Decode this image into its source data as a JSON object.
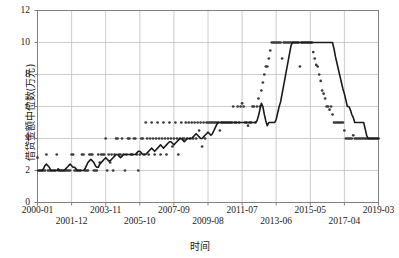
{
  "chart_data": {
    "type": "line",
    "title": "",
    "xlabel": "时间",
    "ylabel": "借贷金额中位数(万元)",
    "ylim": [
      0,
      12
    ],
    "yticks": [
      0,
      2,
      4,
      6,
      8,
      10,
      12
    ],
    "ytick_labels": [
      "0",
      "2",
      "4",
      "6",
      "8",
      "10",
      "12"
    ],
    "grid": true,
    "legend": "none",
    "xtick_labels": [
      "2000-01",
      "2001-12",
      "2003-11",
      "2005-10",
      "2007-09",
      "2009-08",
      "2011-07",
      "2013-06",
      "2015-05",
      "2017-04",
      "2019-03"
    ],
    "xtick_rows": [
      0,
      1,
      0,
      1,
      0,
      1,
      0,
      1,
      0,
      1,
      0
    ],
    "x_start": "2000-01",
    "x_end": "2019-03",
    "x_index_range": [
      0,
      230
    ],
    "series": [
      {
        "name": "median-line",
        "type": "line",
        "color": "#1a1a1a",
        "values": [
          2.0,
          2.0,
          2.0,
          2.0,
          2.1,
          2.3,
          2.4,
          2.3,
          2.2,
          2.0,
          2.0,
          2.0,
          2.0,
          2.0,
          2.1,
          2.0,
          2.0,
          2.0,
          2.0,
          2.1,
          2.2,
          2.3,
          2.4,
          2.3,
          2.2,
          2.2,
          2.1,
          2.0,
          2.0,
          2.0,
          2.0,
          2.0,
          2.1,
          2.3,
          2.5,
          2.6,
          2.7,
          2.6,
          2.5,
          2.3,
          2.2,
          2.2,
          2.4,
          2.5,
          2.6,
          2.7,
          2.8,
          2.7,
          2.6,
          2.6,
          2.7,
          2.8,
          2.9,
          3.0,
          3.0,
          2.9,
          2.8,
          2.9,
          3.0,
          3.0,
          3.0,
          3.0,
          3.0,
          3.0,
          3.0,
          3.0,
          3.0,
          3.1,
          3.2,
          3.2,
          3.1,
          3.0,
          3.0,
          3.0,
          3.1,
          3.2,
          3.3,
          3.4,
          3.3,
          3.2,
          3.3,
          3.4,
          3.5,
          3.6,
          3.5,
          3.4,
          3.5,
          3.6,
          3.7,
          3.8,
          3.8,
          3.7,
          3.6,
          3.7,
          3.8,
          3.9,
          4.0,
          4.0,
          3.9,
          3.8,
          3.9,
          4.0,
          4.0,
          4.0,
          4.0,
          4.1,
          4.2,
          4.3,
          4.2,
          4.1,
          4.0,
          4.0,
          4.1,
          4.2,
          4.3,
          4.4,
          4.3,
          4.2,
          4.3,
          4.5,
          4.7,
          4.9,
          5.0,
          5.0,
          5.0,
          5.0,
          5.0,
          5.0,
          5.0,
          5.0,
          5.0,
          5.0,
          5.0,
          5.0,
          5.0,
          5.0,
          5.0,
          5.0,
          5.0,
          5.0,
          5.0,
          5.0,
          5.0,
          5.0,
          5.0,
          5.0,
          5.0,
          5.0,
          5.1,
          5.4,
          5.8,
          6.2,
          6.0,
          5.5,
          5.1,
          4.8,
          5.0,
          5.0,
          5.0,
          5.0,
          5.0,
          5.2,
          5.6,
          6.0,
          6.3,
          6.8,
          7.3,
          7.8,
          8.3,
          8.8,
          9.3,
          9.8,
          10.0,
          10.0,
          10.0,
          10.0,
          10.0,
          10.0,
          10.0,
          10.0,
          10.0,
          10.0,
          10.0,
          10.0,
          10.0,
          10.0,
          10.0,
          10.0,
          10.0,
          10.0,
          10.0,
          10.0,
          10.0,
          10.0,
          10.0,
          10.0,
          10.0,
          10.0,
          10.0,
          10.0,
          9.6,
          9.1,
          8.7,
          8.3,
          7.9,
          7.5,
          7.1,
          6.8,
          6.4,
          6.0,
          6.0,
          5.8,
          5.5,
          5.3,
          5.0,
          5.0,
          5.0,
          5.0,
          5.0,
          5.0,
          5.0,
          4.6,
          4.2,
          4.0,
          4.0,
          4.0,
          4.0,
          4.0,
          4.0,
          4.0,
          4.0
        ]
      },
      {
        "name": "monthly-observations",
        "type": "scatter",
        "color": "#3a3a3a",
        "points": [
          [
            0,
            2.8
          ],
          [
            1,
            2.0
          ],
          [
            2,
            2.0
          ],
          [
            3,
            2.0
          ],
          [
            4,
            2.0
          ],
          [
            5,
            2.0
          ],
          [
            6,
            3.0
          ],
          [
            7,
            2.0
          ],
          [
            8,
            2.0
          ],
          [
            9,
            2.0
          ],
          [
            10,
            2.0
          ],
          [
            11,
            2.0
          ],
          [
            12,
            2.0
          ],
          [
            13,
            3.0
          ],
          [
            14,
            2.0
          ],
          [
            15,
            2.0
          ],
          [
            16,
            2.0
          ],
          [
            17,
            2.0
          ],
          [
            18,
            2.0
          ],
          [
            19,
            2.0
          ],
          [
            20,
            2.0
          ],
          [
            21,
            2.0
          ],
          [
            22,
            2.0
          ],
          [
            23,
            3.0
          ],
          [
            24,
            3.0
          ],
          [
            25,
            2.0
          ],
          [
            26,
            2.0
          ],
          [
            27,
            2.0
          ],
          [
            28,
            2.0
          ],
          [
            29,
            2.0
          ],
          [
            30,
            3.0
          ],
          [
            31,
            3.0
          ],
          [
            32,
            2.0
          ],
          [
            33,
            2.0
          ],
          [
            34,
            2.0
          ],
          [
            35,
            3.0
          ],
          [
            36,
            3.0
          ],
          [
            37,
            3.0
          ],
          [
            38,
            2.0
          ],
          [
            39,
            2.0
          ],
          [
            40,
            2.0
          ],
          [
            41,
            3.0
          ],
          [
            42,
            2.5
          ],
          [
            43,
            3.0
          ],
          [
            44,
            3.0
          ],
          [
            45,
            3.0
          ],
          [
            46,
            4.0
          ],
          [
            47,
            2.0
          ],
          [
            48,
            3.0
          ],
          [
            49,
            2.5
          ],
          [
            50,
            3.0
          ],
          [
            51,
            2.0
          ],
          [
            52,
            3.0
          ],
          [
            53,
            4.0
          ],
          [
            54,
            4.0
          ],
          [
            55,
            3.0
          ],
          [
            56,
            3.0
          ],
          [
            57,
            4.0
          ],
          [
            58,
            3.0
          ],
          [
            59,
            2.0
          ],
          [
            60,
            3.0
          ],
          [
            61,
            4.0
          ],
          [
            62,
            4.0
          ],
          [
            63,
            3.0
          ],
          [
            64,
            3.0
          ],
          [
            65,
            4.0
          ],
          [
            66,
            4.0
          ],
          [
            67,
            3.0
          ],
          [
            68,
            2.0
          ],
          [
            69,
            3.0
          ],
          [
            70,
            4.0
          ],
          [
            71,
            4.0
          ],
          [
            72,
            3.0
          ],
          [
            73,
            5.0
          ],
          [
            74,
            4.0
          ],
          [
            75,
            3.0
          ],
          [
            76,
            4.0
          ],
          [
            77,
            5.0
          ],
          [
            78,
            4.0
          ],
          [
            79,
            3.0
          ],
          [
            80,
            4.0
          ],
          [
            81,
            5.0
          ],
          [
            82,
            4.0
          ],
          [
            83,
            3.0
          ],
          [
            84,
            4.0
          ],
          [
            85,
            5.0
          ],
          [
            86,
            4.0
          ],
          [
            87,
            3.0
          ],
          [
            88,
            4.0
          ],
          [
            89,
            5.0
          ],
          [
            90,
            4.0
          ],
          [
            91,
            3.5
          ],
          [
            92,
            4.0
          ],
          [
            93,
            5.0
          ],
          [
            94,
            4.0
          ],
          [
            95,
            3.0
          ],
          [
            96,
            4.0
          ],
          [
            97,
            5.0
          ],
          [
            98,
            4.0
          ],
          [
            99,
            4.0
          ],
          [
            100,
            5.0
          ],
          [
            101,
            4.0
          ],
          [
            102,
            5.0
          ],
          [
            103,
            4.0
          ],
          [
            104,
            5.0
          ],
          [
            105,
            4.0
          ],
          [
            106,
            5.0
          ],
          [
            107,
            4.0
          ],
          [
            108,
            5.0
          ],
          [
            109,
            4.5
          ],
          [
            110,
            5.0
          ],
          [
            111,
            3.5
          ],
          [
            112,
            5.0
          ],
          [
            113,
            4.0
          ],
          [
            114,
            5.0
          ],
          [
            115,
            5.0
          ],
          [
            116,
            5.0
          ],
          [
            117,
            5.0
          ],
          [
            118,
            5.0
          ],
          [
            119,
            5.0
          ],
          [
            120,
            5.0
          ],
          [
            121,
            5.0
          ],
          [
            122,
            5.0
          ],
          [
            123,
            4.5
          ],
          [
            124,
            5.0
          ],
          [
            125,
            5.0
          ],
          [
            126,
            5.0
          ],
          [
            127,
            5.0
          ],
          [
            128,
            5.0
          ],
          [
            129,
            5.0
          ],
          [
            130,
            5.0
          ],
          [
            131,
            5.0
          ],
          [
            132,
            6.0
          ],
          [
            133,
            5.0
          ],
          [
            134,
            5.0
          ],
          [
            135,
            6.0
          ],
          [
            136,
            5.0
          ],
          [
            137,
            6.0
          ],
          [
            138,
            6.2
          ],
          [
            139,
            6.0
          ],
          [
            140,
            5.0
          ],
          [
            141,
            5.0
          ],
          [
            142,
            4.8
          ],
          [
            143,
            5.0
          ],
          [
            144,
            5.0
          ],
          [
            145,
            6.0
          ],
          [
            146,
            6.0
          ],
          [
            147,
            5.0
          ],
          [
            148,
            6.0
          ],
          [
            149,
            6.5
          ],
          [
            150,
            6.0
          ],
          [
            151,
            7.0
          ],
          [
            152,
            7.5
          ],
          [
            153,
            8.0
          ],
          [
            154,
            8.5
          ],
          [
            155,
            8.5
          ],
          [
            156,
            9.0
          ],
          [
            157,
            9.5
          ],
          [
            158,
            10.0
          ],
          [
            159,
            10.0
          ],
          [
            160,
            10.0
          ],
          [
            161,
            10.0
          ],
          [
            162,
            10.0
          ],
          [
            163,
            10.0
          ],
          [
            164,
            10.0
          ],
          [
            165,
            9.0
          ],
          [
            166,
            10.0
          ],
          [
            167,
            10.0
          ],
          [
            168,
            10.0
          ],
          [
            169,
            10.0
          ],
          [
            170,
            10.0
          ],
          [
            171,
            10.0
          ],
          [
            172,
            10.0
          ],
          [
            173,
            10.0
          ],
          [
            174,
            10.0
          ],
          [
            175,
            10.0
          ],
          [
            176,
            10.0
          ],
          [
            177,
            8.5
          ],
          [
            178,
            10.0
          ],
          [
            179,
            10.0
          ],
          [
            180,
            10.0
          ],
          [
            181,
            10.0
          ],
          [
            182,
            10.0
          ],
          [
            183,
            10.0
          ],
          [
            184,
            10.0
          ],
          [
            185,
            10.0
          ],
          [
            186,
            9.4
          ],
          [
            187,
            9.0
          ],
          [
            188,
            8.6
          ],
          [
            189,
            8.5
          ],
          [
            190,
            8.0
          ],
          [
            191,
            7.6
          ],
          [
            192,
            7.0
          ],
          [
            193,
            6.8
          ],
          [
            194,
            6.5
          ],
          [
            195,
            6.0
          ],
          [
            196,
            6.0
          ],
          [
            197,
            5.8
          ],
          [
            198,
            6.0
          ],
          [
            199,
            5.5
          ],
          [
            200,
            5.0
          ],
          [
            201,
            5.0
          ],
          [
            202,
            5.0
          ],
          [
            203,
            5.0
          ],
          [
            204,
            5.0
          ],
          [
            205,
            5.0
          ],
          [
            206,
            5.0
          ],
          [
            207,
            4.5
          ],
          [
            208,
            4.0
          ],
          [
            209,
            4.0
          ],
          [
            210,
            4.0
          ],
          [
            211,
            4.0
          ],
          [
            212,
            4.0
          ],
          [
            213,
            4.2
          ],
          [
            214,
            4.0
          ],
          [
            215,
            4.0
          ],
          [
            216,
            4.0
          ],
          [
            217,
            4.0
          ],
          [
            218,
            4.0
          ],
          [
            219,
            4.0
          ],
          [
            220,
            4.0
          ],
          [
            221,
            4.0
          ],
          [
            222,
            4.0
          ],
          [
            223,
            4.0
          ],
          [
            224,
            4.0
          ],
          [
            225,
            4.0
          ],
          [
            226,
            4.0
          ],
          [
            227,
            4.0
          ],
          [
            228,
            4.0
          ],
          [
            229,
            4.0
          ],
          [
            230,
            4.0
          ]
        ]
      }
    ]
  },
  "style": {
    "grid_color": "#bfbfbf",
    "frame_color": "#808080",
    "line_color": "#1a1a1a",
    "point_color": "#3a3a3a",
    "background": "#ffffff"
  }
}
